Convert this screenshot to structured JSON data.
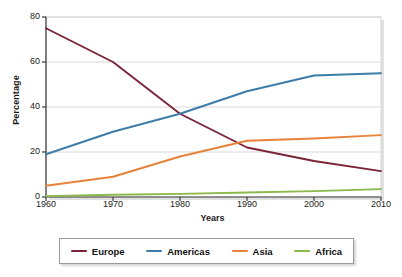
{
  "chart_data": {
    "type": "line",
    "title": "",
    "xlabel": "Years",
    "ylabel": "Percentage",
    "x": [
      1960,
      1970,
      1980,
      1990,
      2000,
      2010
    ],
    "categories": [
      "1960",
      "1970",
      "1980",
      "1990",
      "2000",
      "2010"
    ],
    "xlim": [
      1960,
      2010
    ],
    "ylim": [
      0,
      80
    ],
    "yticks": [
      0,
      20,
      40,
      60,
      80
    ],
    "ytick_labels": [
      "0",
      "20",
      "40",
      "60",
      "80"
    ],
    "xticks": [
      1960,
      1970,
      1980,
      1990,
      2000,
      2010
    ],
    "xtick_labels": [
      "1960",
      "1970",
      "1980",
      "1990",
      "2000",
      "2010"
    ],
    "grid": "horizontal",
    "legend_position": "bottom",
    "series": [
      {
        "name": "Europe",
        "color": "#7b2438",
        "values": [
          75,
          60,
          37,
          22,
          16,
          11.5
        ]
      },
      {
        "name": "Americas",
        "color": "#3d7ca8",
        "values": [
          19,
          29,
          37,
          47,
          54,
          55
        ]
      },
      {
        "name": "Asia",
        "color": "#e8813a",
        "values": [
          5,
          9,
          18,
          25,
          26,
          27.5
        ]
      },
      {
        "name": "Africa",
        "color": "#8cb84b",
        "values": [
          0.4,
          1,
          1.4,
          2,
          2.6,
          3.5
        ]
      }
    ]
  },
  "axis": {
    "ylabel": "Percentage",
    "xlabel": "Years"
  },
  "legend": {
    "items": [
      {
        "label": "Europe",
        "color": "#7b2438"
      },
      {
        "label": "Americas",
        "color": "#3d7ca8"
      },
      {
        "label": "Asia",
        "color": "#e8813a"
      },
      {
        "label": "Africa",
        "color": "#8cb84b"
      }
    ]
  }
}
